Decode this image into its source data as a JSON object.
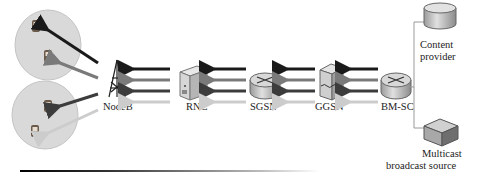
{
  "nodes": {
    "nodeb": {
      "label": "NodeB",
      "icon": "cell-tower-icon"
    },
    "rnc": {
      "label": "RNC",
      "icon": "server-icon"
    },
    "sgsn": {
      "label": "SGSN",
      "icon": "router-icon"
    },
    "ggsn": {
      "label": "GGSN",
      "icon": "gateway-server-icon"
    },
    "bmsc": {
      "label": "BM-SC",
      "icon": "router-icon"
    },
    "content_provider": {
      "label_line1": "Content",
      "label_line2": "provider",
      "icon": "database-cylinder-icon"
    },
    "multicast_source": {
      "label_line1": "Multicast",
      "label_line2": "broadcast source",
      "icon": "box-server-icon"
    }
  },
  "cells": [
    {
      "name": "cell-1",
      "devices": 2
    },
    {
      "name": "cell-2",
      "devices": 2
    }
  ],
  "arrow_colors": [
    "#1a1a1a",
    "#7a7a7a",
    "#3c3c3c",
    "#cccccc"
  ],
  "colors": {
    "cell_fill": "#d9d9d9",
    "cell_stroke": "#bdbdbd",
    "device_color": "#6b5a4a",
    "node_body": "#c8c8c8"
  }
}
